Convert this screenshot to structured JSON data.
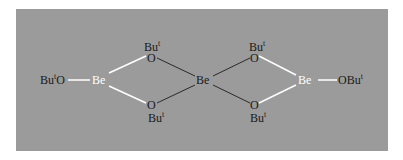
{
  "diagram": {
    "title": "",
    "colors": {
      "background": "#9b9b9b",
      "outer_bond": "#ffffff",
      "inner_bond": "#2a2a2a",
      "be_label": "#ffffff",
      "o_label": "#1a1a1a"
    },
    "atoms": {
      "left_terminal": {
        "base": "Bu",
        "sup": "t",
        "tail": "O"
      },
      "be_left": "Be",
      "be_center": "Be",
      "be_right": "Be",
      "right_terminal": {
        "head": "OBu",
        "sup": "t"
      },
      "o_bridge_tl": "O",
      "o_bridge_bl": "O",
      "o_bridge_tr": "O",
      "o_bridge_br": "O",
      "bu_label": "Bu",
      "bu_sup": "t"
    }
  }
}
